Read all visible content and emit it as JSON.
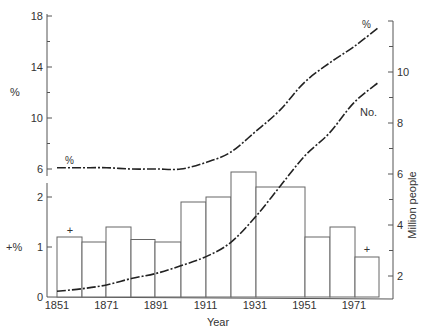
{
  "chart_data": {
    "type": "bar+line",
    "title": "",
    "xlabel": "Year",
    "x_ticks": [
      "1851",
      "1871",
      "1891",
      "1911",
      "1931",
      "1951",
      "1971"
    ],
    "left_upper_axis": {
      "label": "%",
      "ticks": [
        6,
        10,
        14,
        18
      ],
      "range": [
        6,
        18
      ]
    },
    "left_lower_axis": {
      "label": "+%",
      "ticks": [
        0,
        1,
        2
      ],
      "range": [
        0,
        2
      ]
    },
    "right_axis": {
      "label": "Million people",
      "ticks": [
        2,
        4,
        6,
        8,
        10
      ],
      "range": [
        1,
        12
      ]
    },
    "bars": {
      "name": "+%",
      "axis": "left_lower",
      "categories": [
        "1851",
        "1861",
        "1871",
        "1881",
        "1891",
        "1901",
        "1911",
        "1921",
        "1931-1951",
        "1951",
        "1961",
        "1971"
      ],
      "values": [
        1.2,
        1.1,
        1.4,
        1.15,
        1.1,
        1.9,
        2.0,
        2.5,
        2.2,
        1.2,
        1.4,
        0.8
      ],
      "markers": [
        {
          "index": 0,
          "symbol": "+"
        },
        {
          "index": 11,
          "symbol": "+"
        }
      ]
    },
    "series": [
      {
        "name": "%",
        "axis": "left_upper",
        "style": "dash-dot",
        "x": [
          1851,
          1861,
          1871,
          1881,
          1891,
          1901,
          1911,
          1921,
          1931,
          1941,
          1951,
          1961,
          1971,
          1981
        ],
        "values": [
          6.1,
          6.1,
          6.1,
          6.0,
          6.0,
          6.0,
          6.5,
          7.3,
          8.9,
          10.6,
          12.8,
          14.3,
          15.6,
          17.1
        ]
      },
      {
        "name": "No.",
        "axis": "right",
        "style": "dash-dot",
        "x": [
          1851,
          1861,
          1871,
          1881,
          1891,
          1901,
          1911,
          1921,
          1931,
          1941,
          1951,
          1961,
          1971,
          1981
        ],
        "values": [
          1.4,
          1.5,
          1.65,
          1.9,
          2.1,
          2.4,
          2.75,
          3.3,
          4.3,
          5.5,
          6.7,
          7.6,
          8.8,
          9.6
        ]
      }
    ],
    "annotations": [
      "%",
      "No.",
      "+",
      "+"
    ]
  },
  "labels": {
    "left_upper_axis_label": "%",
    "left_lower_axis_label": "+%",
    "right_axis_label": "Million people",
    "x_axis_label": "Year",
    "series_pct_start_label": "%",
    "series_pct_end_label": "%",
    "series_no_label": "No.",
    "plus_marker": "+"
  }
}
